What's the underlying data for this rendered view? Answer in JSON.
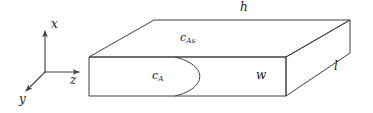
{
  "figure": {
    "name": "rectangular-slab-diffusion-diagram",
    "background_color": "#ffffff",
    "line_color": "#3f3f3f",
    "text_color": "#1a1a1a",
    "width": 373,
    "height": 113
  },
  "axes": {
    "origin": {
      "x": 45,
      "y": 72
    },
    "items": [
      {
        "id": "x",
        "label": "x",
        "direction": "up",
        "tip": {
          "x": 45,
          "y": 30
        },
        "label_pos": {
          "x": 51,
          "y": 24
        }
      },
      {
        "id": "z",
        "label": "z",
        "direction": "right",
        "tip": {
          "x": 80,
          "y": 72
        },
        "label_pos": {
          "x": 71,
          "y": 76
        }
      },
      {
        "id": "y",
        "label": "y",
        "direction": "down-left",
        "tip": {
          "x": 25,
          "y": 92
        },
        "label_pos": {
          "x": 20,
          "y": 94
        }
      }
    ]
  },
  "solid": {
    "description": "rectangular slab drawn in oblique projection",
    "vertices": {
      "front_top_left": {
        "x": 89,
        "y": 57
      },
      "front_top_right": {
        "x": 286,
        "y": 57
      },
      "front_bot_left": {
        "x": 89,
        "y": 96
      },
      "front_bot_right": {
        "x": 286,
        "y": 96
      },
      "back_top_left": {
        "x": 154,
        "y": 20
      },
      "back_top_right": {
        "x": 350,
        "y": 20
      },
      "back_bot_right": {
        "x": 350,
        "y": 53
      }
    }
  },
  "curve": {
    "name": "concentration-profile-curve",
    "start": {
      "x": 175,
      "y": 57
    },
    "end": {
      "x": 175,
      "y": 96
    },
    "peak_x": 203
  },
  "labels": {
    "h": {
      "text": "h",
      "sub": "",
      "x": 240,
      "y": 3,
      "name": "dimension-label-h"
    },
    "l": {
      "text": "l",
      "sub": "",
      "x": 334,
      "y": 62,
      "name": "dimension-label-l"
    },
    "w": {
      "text": "w",
      "sub": "",
      "x": 256,
      "y": 70,
      "name": "dimension-label-w"
    },
    "cAs": {
      "text": "c",
      "sub": "As",
      "x": 180,
      "y": 33,
      "name": "surface-concentration-label"
    },
    "cA": {
      "text": "c",
      "sub": "A",
      "x": 152,
      "y": 71,
      "name": "bulk-concentration-label"
    }
  }
}
